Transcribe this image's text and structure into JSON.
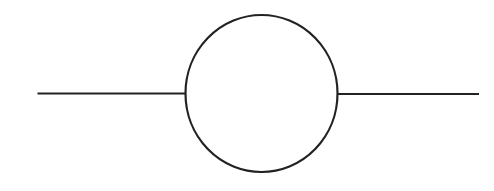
{
  "diagram": {
    "width": 494,
    "height": 191,
    "background": "#ffffff",
    "stroke_color": "#222222",
    "stroke_width": 2.2,
    "circle": {
      "cx": 261.5,
      "cy": 93.5,
      "rx": 76,
      "ry": 78.5
    },
    "left_wire": {
      "x1": 37.5,
      "y1": 93.5,
      "x2": 185.5,
      "y2": 93.5
    },
    "right_wire": {
      "x1": 337.5,
      "y1": 94,
      "x2": 479,
      "y2": 94
    }
  }
}
